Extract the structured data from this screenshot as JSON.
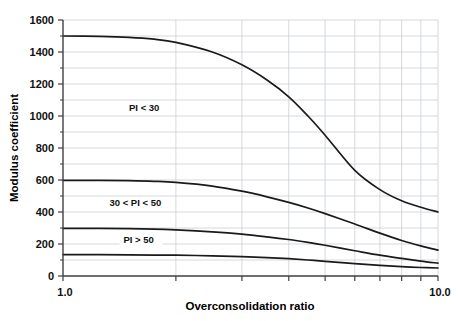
{
  "chart_data": {
    "type": "line",
    "title": "",
    "xlabel": "Overconsolidation ratio",
    "ylabel": "Modulus coefficient",
    "xscale": "log",
    "xlim": [
      1.0,
      10.0
    ],
    "ylim": [
      0,
      1600
    ],
    "grid": true,
    "legend_position": "inline-annotations",
    "x_tick_labels": [
      "1.0",
      "10.0"
    ],
    "x_tick_values": [
      1,
      2,
      3,
      4,
      5,
      6,
      7,
      8,
      9,
      10
    ],
    "y_tick_labels": [
      "0",
      "200",
      "400",
      "600",
      "800",
      "1000",
      "1200",
      "1400",
      "1600"
    ],
    "y_tick_values": [
      0,
      200,
      400,
      600,
      800,
      1000,
      1200,
      1400,
      1600
    ],
    "y_minor_tick_values": [
      100,
      300,
      500,
      700,
      900,
      1100,
      1300,
      1500
    ],
    "x": [
      1.0,
      1.25,
      1.5,
      1.75,
      2.0,
      2.5,
      3.0,
      3.5,
      4.0,
      4.5,
      5.0,
      6.0,
      7.0,
      8.0,
      9.0,
      10.0
    ],
    "series": [
      {
        "name": "PI < 30",
        "values": [
          1500,
          1498,
          1492,
          1480,
          1460,
          1400,
          1320,
          1225,
          1120,
          1000,
          880,
          660,
          540,
          470,
          430,
          400
        ],
        "annotation": "PI < 30",
        "annotation_x": 1.5,
        "annotation_y": 1030
      },
      {
        "name": "30 < PI < 50",
        "values": [
          598,
          598,
          596,
          592,
          585,
          562,
          530,
          495,
          460,
          425,
          390,
          325,
          268,
          222,
          188,
          162
        ],
        "annotation": "30 < PI < 50",
        "annotation_x": 1.33,
        "annotation_y": 435
      },
      {
        "name": "PI > 50",
        "values": [
          298,
          298,
          296,
          293,
          288,
          276,
          262,
          245,
          228,
          210,
          192,
          158,
          130,
          110,
          93,
          80
        ],
        "annotation": "PI > 50",
        "annotation_x": 1.45,
        "annotation_y": 205
      },
      {
        "name": "lowest-curve",
        "values": [
          133,
          133,
          132,
          131,
          130,
          126,
          121,
          115,
          108,
          100,
          92,
          77,
          66,
          58,
          53,
          50
        ],
        "annotation": "",
        "annotation_x": null,
        "annotation_y": null
      }
    ],
    "colors": {
      "curve": "#1a1a1a",
      "axis": "#3f3f3f",
      "grid": "#c9cfd6",
      "background": "#ffffff"
    }
  },
  "axes": {
    "y_axis_title": "Modulus coefficient",
    "x_axis_title": "Overconsolidation ratio",
    "x_min_label": "1.0",
    "x_max_label": "10.0"
  }
}
